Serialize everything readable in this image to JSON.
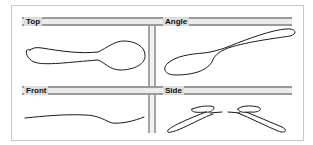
{
  "diagram": {
    "panels": [
      {
        "id": "top",
        "label": "Top"
      },
      {
        "id": "angle",
        "label": "Angle"
      },
      {
        "id": "front",
        "label": "Front"
      },
      {
        "id": "side",
        "label": "Side"
      }
    ],
    "colors": {
      "frame_border": "#c8c8c8",
      "bar_line": "#9a9a9a",
      "bar_fill": "#ececec",
      "stroke": "#1a1a1a"
    }
  }
}
